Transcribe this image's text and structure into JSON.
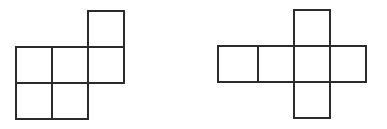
{
  "page": {
    "background_color": "#ffffff",
    "width": 387,
    "height": 129
  },
  "style": {
    "stroke_color": "#2b2b2b",
    "fill_color": "#ffffff",
    "stroke_width": 1.6,
    "cell_size": 36
  },
  "figures": [
    {
      "id": "left-figure",
      "name": "left-polyomino-net",
      "label": "",
      "square_count": 4,
      "shape": "S/Z-shaped net: 2x2 block with a column of two squares offset upward on the right",
      "bounds": {
        "x": 16,
        "y": 11,
        "width": 108,
        "height": 108
      },
      "squares": [
        {
          "name": "top-right-square",
          "x": 88,
          "y": 11,
          "w": 36,
          "h": 36
        },
        {
          "name": "upper-left-square",
          "x": 16,
          "y": 47,
          "w": 36,
          "h": 36
        },
        {
          "name": "upper-middle-square",
          "x": 52,
          "y": 47,
          "w": 36,
          "h": 36
        },
        {
          "name": "upper-right-square",
          "x": 88,
          "y": 47,
          "w": 36,
          "h": 36
        },
        {
          "name": "lower-left-square",
          "x": 16,
          "y": 83,
          "w": 36,
          "h": 36
        },
        {
          "name": "lower-middle-square",
          "x": 52,
          "y": 83,
          "w": 36,
          "h": 36
        }
      ]
    },
    {
      "id": "right-figure",
      "name": "right-polyomino-net",
      "label": "",
      "square_count": 6,
      "shape": "Cross/plus-shaped cube net: row of four squares with one square above and one below the third square",
      "bounds": {
        "x": 218,
        "y": 10,
        "width": 148,
        "height": 108
      },
      "squares": [
        {
          "name": "top-square",
          "x": 294,
          "y": 10,
          "w": 36,
          "h": 36
        },
        {
          "name": "row-square-1",
          "x": 218,
          "y": 46,
          "w": 40,
          "h": 36
        },
        {
          "name": "row-square-2",
          "x": 258,
          "y": 46,
          "w": 36,
          "h": 36
        },
        {
          "name": "row-square-3",
          "x": 294,
          "y": 46,
          "w": 36,
          "h": 36
        },
        {
          "name": "row-square-4",
          "x": 330,
          "y": 46,
          "w": 36,
          "h": 36
        },
        {
          "name": "bottom-square",
          "x": 294,
          "y": 82,
          "w": 36,
          "h": 36
        }
      ]
    }
  ]
}
